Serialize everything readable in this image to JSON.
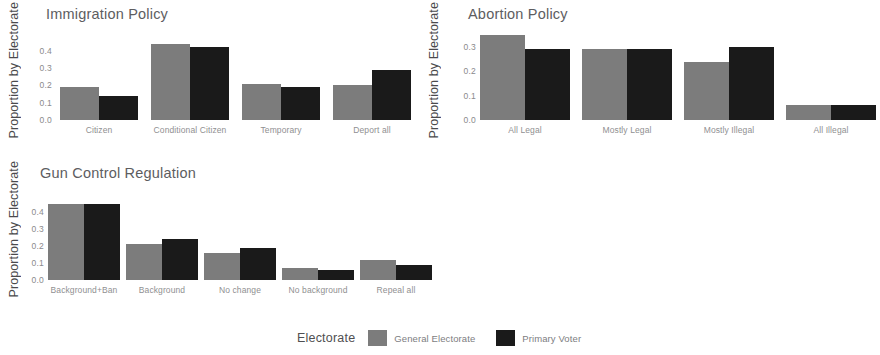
{
  "colors": {
    "general_electorate": "#7c7c7c",
    "primary_voter": "#1a1a1a",
    "text": "#58585a",
    "background": "#ffffff"
  },
  "legend": {
    "title": "Electorate",
    "items": [
      {
        "label": "General Electorate",
        "color": "#7c7c7c",
        "swatch": "gray-swatch"
      },
      {
        "label": "Primary Voter",
        "color": "#1a1a1a",
        "swatch": "black-swatch"
      }
    ]
  },
  "chart_data": [
    {
      "type": "bar",
      "title": "Immigration Policy",
      "xlabel": "",
      "ylabel": "Proportion by Electorate",
      "categories": [
        "Citizen",
        "Conditional Citizen",
        "Temporary",
        "Deport all"
      ],
      "yticks": [
        "0.0",
        "0.1",
        "0.2",
        "0.3",
        "0.4"
      ],
      "ylim": [
        0,
        0.45
      ],
      "grid": false,
      "legend_position": "bottom",
      "series": [
        {
          "name": "General Electorate",
          "color": "#7c7c7c",
          "values": [
            0.19,
            0.44,
            0.21,
            0.2
          ]
        },
        {
          "name": "Primary Voter",
          "color": "#1a1a1a",
          "values": [
            0.14,
            0.42,
            0.19,
            0.29
          ]
        }
      ]
    },
    {
      "type": "bar",
      "title": "Abortion Policy",
      "xlabel": "",
      "ylabel": "Proportion by Electorate",
      "categories": [
        "All Legal",
        "Mostly Legal",
        "Mostly Illegal",
        "All Illegal"
      ],
      "yticks": [
        "0.0",
        "0.1",
        "0.2",
        "0.3"
      ],
      "ylim": [
        0,
        0.37
      ],
      "grid": false,
      "legend_position": "bottom",
      "series": [
        {
          "name": "General Electorate",
          "color": "#7c7c7c",
          "values": [
            0.35,
            0.29,
            0.24,
            0.06
          ]
        },
        {
          "name": "Primary Voter",
          "color": "#1a1a1a",
          "values": [
            0.29,
            0.29,
            0.3,
            0.06
          ]
        }
      ]
    },
    {
      "type": "bar",
      "title": "Gun Control Regulation",
      "xlabel": "",
      "ylabel": "Proportion by Electorate",
      "categories": [
        "Background+Ban",
        "Background",
        "No change",
        "No background",
        "Repeal all"
      ],
      "yticks": [
        "0.0",
        "0.1",
        "0.2",
        "0.3",
        "0.4"
      ],
      "ylim": [
        0,
        0.46
      ],
      "grid": false,
      "legend_position": "bottom",
      "series": [
        {
          "name": "General Electorate",
          "color": "#7c7c7c",
          "values": [
            0.45,
            0.21,
            0.16,
            0.07,
            0.12
          ]
        },
        {
          "name": "Primary Voter",
          "color": "#1a1a1a",
          "values": [
            0.45,
            0.24,
            0.19,
            0.06,
            0.09
          ]
        }
      ]
    }
  ]
}
